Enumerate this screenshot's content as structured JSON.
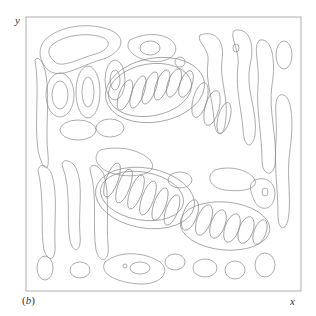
{
  "figure": {
    "panel_label": "(b)",
    "panel_letter": "b",
    "x_axis_label": "x",
    "y_axis_label": "y",
    "plot_type": "contour",
    "line_color": "#8a8a8a",
    "background_color": "#ffffff",
    "frame": {
      "left": 26,
      "top": 17,
      "right": 301,
      "bottom": 291
    }
  }
}
